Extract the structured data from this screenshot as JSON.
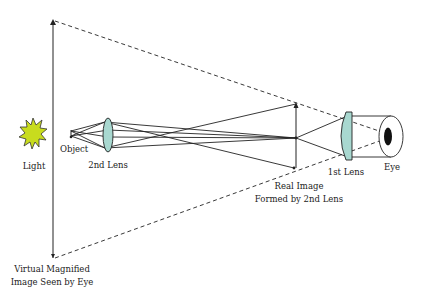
{
  "diagram": {
    "labels": {
      "light": "Light",
      "object": "Object",
      "second_lens": "2nd Lens",
      "first_lens": "1st Lens",
      "eye": "Eye",
      "real_image_line1": "Real Image",
      "real_image_line2": "Formed by 2nd Lens",
      "virtual_image_line1": "Virtual Magnified",
      "virtual_image_line2": "Image Seen by Eye"
    },
    "colors": {
      "light_fill": "#c8dc1e",
      "lens_fill": "#a8d8d0",
      "line": "#222222",
      "pupil": "#111111"
    }
  }
}
